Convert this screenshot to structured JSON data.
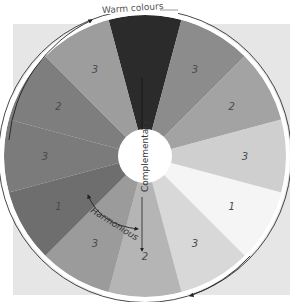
{
  "diagram": {
    "top_label": "Warm colours",
    "centre_label": "Complementary",
    "harmonious_label": "Harmonious",
    "sectors": [
      {
        "label": "",
        "color": "#2b2b2b"
      },
      {
        "label": "3",
        "color": "#8c8c8c"
      },
      {
        "label": "2",
        "color": "#a3a3a3"
      },
      {
        "label": "3",
        "color": "#cfcfcf"
      },
      {
        "label": "1",
        "color": "#f5f5f5"
      },
      {
        "label": "3",
        "color": "#d8d8d8"
      },
      {
        "label": "2",
        "color": "#b5b5b5"
      },
      {
        "label": "3",
        "color": "#9b9b9b"
      },
      {
        "label": "1",
        "color": "#6e6e6e"
      },
      {
        "label": "3",
        "color": "#7b7b7b"
      },
      {
        "label": "2",
        "color": "#7e7e7e"
      },
      {
        "label": "3",
        "color": "#9d9d9d"
      }
    ],
    "ring_color": "#333333",
    "centre_color": "#ffffff"
  }
}
